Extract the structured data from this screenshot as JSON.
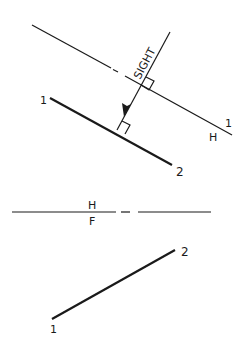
{
  "header": {
    "partial_title": "VIEW"
  },
  "auxiliary_view": {
    "fold_line_labels": {
      "upper": "1",
      "lower": "H"
    },
    "sight_label": "SIGHT",
    "line_points": {
      "start": "1",
      "end": "2"
    }
  },
  "front_view": {
    "fold_line_labels": {
      "upper": "H",
      "lower": "F"
    },
    "line_points": {
      "start": "1",
      "end": "2"
    }
  },
  "colors": {
    "line": "#1a1a1a",
    "background": "#ffffff"
  }
}
